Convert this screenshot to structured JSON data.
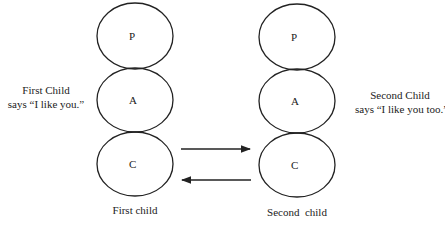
{
  "left_child": {
    "states": [
      "P",
      "A",
      "C"
    ],
    "caption": "First child",
    "speech_line1": "First Child",
    "speech_line2": "says “I like you.”"
  },
  "right_child": {
    "states": [
      "P",
      "A",
      "C"
    ],
    "caption": "Second  child",
    "speech_line1": "Second Child",
    "speech_line2": "says “I like you too.”"
  },
  "arrows": [
    {
      "from": "left_child.C",
      "to": "right_child.C",
      "direction": "right"
    },
    {
      "from": "right_child.C",
      "to": "left_child.C",
      "direction": "left"
    }
  ]
}
